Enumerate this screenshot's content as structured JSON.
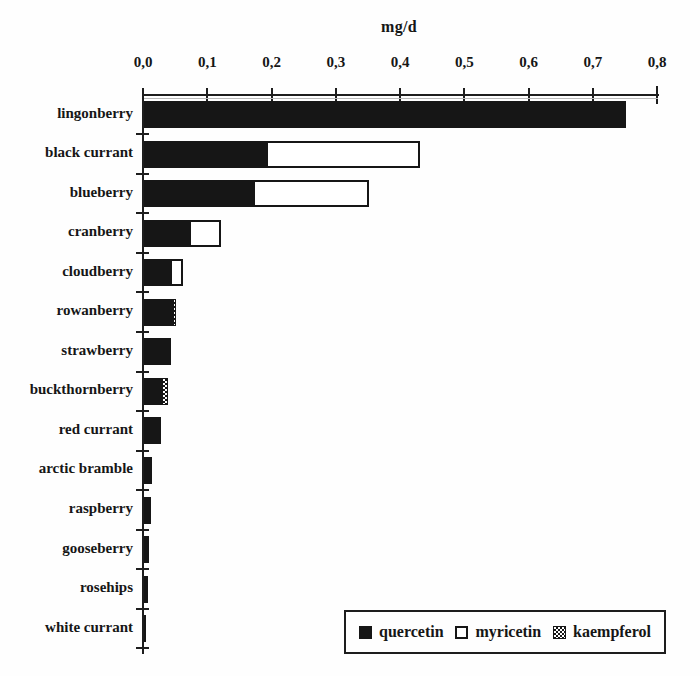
{
  "colors": {
    "ink": "#161616",
    "background": "#fefefe"
  },
  "chart_data": {
    "type": "bar",
    "orientation": "horizontal",
    "stacked": true,
    "title": "",
    "xlabel": "mg/d",
    "ylabel": "",
    "xlim": [
      0,
      0.8
    ],
    "decimal_separator": ",",
    "x_tick_labels": [
      "0,0",
      "0,1",
      "0,2",
      "0,3",
      "0,4",
      "0,5",
      "0,6",
      "0,7",
      "0,8"
    ],
    "x_tick_values": [
      0,
      0.1,
      0.2,
      0.3,
      0.4,
      0.5,
      0.6,
      0.7,
      0.8
    ],
    "grid": false,
    "categories": [
      "lingonberry",
      "black currant",
      "blueberry",
      "cranberry",
      "cloudberry",
      "rowanberry",
      "strawberry",
      "buckthornberry",
      "red currant",
      "arctic bramble",
      "raspberry",
      "gooseberry",
      "rosehips",
      "white currant"
    ],
    "series": [
      {
        "name": "quercetin",
        "style": "solid-black",
        "values": [
          0.75,
          0.19,
          0.17,
          0.07,
          0.04,
          0.045,
          0.042,
          0.028,
          0.026,
          0.012,
          0.011,
          0.008,
          0,
          0.002
        ]
      },
      {
        "name": "myricetin",
        "style": "white-outlined",
        "values": [
          0,
          0.24,
          0.18,
          0.05,
          0.02,
          0,
          0,
          0,
          0,
          0,
          0,
          0,
          0.007,
          0
        ]
      },
      {
        "name": "kaempferol",
        "style": "checkered",
        "values": [
          0,
          0,
          0,
          0,
          0,
          0.005,
          0,
          0.01,
          0,
          0,
          0,
          0,
          0,
          0
        ]
      }
    ],
    "legend": {
      "position": "bottom-right",
      "entries": [
        {
          "label": "quercetin",
          "swatch": "solid-black"
        },
        {
          "label": "myricetin",
          "swatch": "white-outlined"
        },
        {
          "label": "kaempferol",
          "swatch": "checkered"
        }
      ]
    }
  }
}
